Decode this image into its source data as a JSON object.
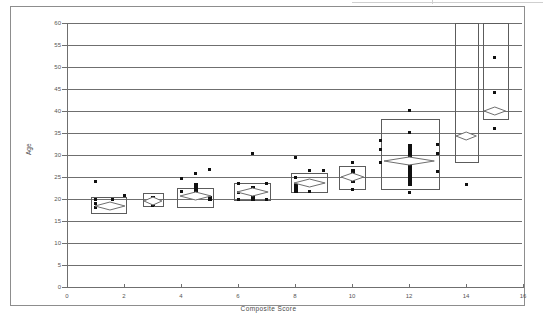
{
  "figure": {
    "background": "#ffffff",
    "frame_color": "#8d8d8d",
    "grid_color": "#6f6f6f",
    "marker_color": "#101010",
    "box_color": "#5c5c5c",
    "diamond_color": "#6f6f6f"
  },
  "chart_data": {
    "type": "scatter",
    "title": "",
    "subtitle": "",
    "xlabel": "Composite Score",
    "ylabel": "Age",
    "xlim": [
      0,
      16
    ],
    "ylim": [
      0,
      60
    ],
    "xticks": [
      0,
      2,
      4,
      6,
      8,
      10,
      12,
      14,
      16
    ],
    "yticks": [
      0,
      5,
      10,
      15,
      20,
      25,
      30,
      35,
      40,
      45,
      50,
      55,
      60
    ],
    "xtick_labels": [
      "0",
      "2",
      "4",
      "6",
      "8",
      "10",
      "12",
      "14",
      "16"
    ],
    "ytick_labels": [
      "0",
      "5",
      "10",
      "15",
      "20",
      "25",
      "30",
      "35",
      "40",
      "45",
      "50",
      "55",
      "60"
    ],
    "grid": "horizontal",
    "legend": "none",
    "points": [
      {
        "x": 1,
        "y": 24
      },
      {
        "x": 1,
        "y": 20
      },
      {
        "x": 1,
        "y": 19
      },
      {
        "x": 1,
        "y": 18
      },
      {
        "x": 1.6,
        "y": 19.8
      },
      {
        "x": 2,
        "y": 20.8
      },
      {
        "x": 3,
        "y": 20.2
      },
      {
        "x": 3,
        "y": 19.4
      },
      {
        "x": 3,
        "y": 18.6
      },
      {
        "x": 4,
        "y": 24.7
      },
      {
        "x": 4,
        "y": 21.7
      },
      {
        "x": 4.5,
        "y": 25.7
      },
      {
        "x": 4.5,
        "y": 23.4
      },
      {
        "x": 4.5,
        "y": 21.5
      },
      {
        "x": 4.5,
        "y": 20.4
      },
      {
        "x": 5,
        "y": 26.6
      },
      {
        "x": 5,
        "y": 20.1
      },
      {
        "x": 6,
        "y": 23.5
      },
      {
        "x": 6,
        "y": 21.5
      },
      {
        "x": 6,
        "y": 19.9
      },
      {
        "x": 6.5,
        "y": 30.4
      },
      {
        "x": 6.5,
        "y": 22.2
      },
      {
        "x": 6.5,
        "y": 20.3
      },
      {
        "x": 7,
        "y": 23.5
      },
      {
        "x": 7,
        "y": 19.9
      },
      {
        "x": 8,
        "y": 29.4
      },
      {
        "x": 8,
        "y": 25.0
      },
      {
        "x": 8,
        "y": 22.6
      },
      {
        "x": 8.5,
        "y": 26.5
      },
      {
        "x": 8.5,
        "y": 23.2
      },
      {
        "x": 8.5,
        "y": 21.6
      },
      {
        "x": 9,
        "y": 26.4
      },
      {
        "x": 10,
        "y": 28.4
      },
      {
        "x": 10,
        "y": 26.5
      },
      {
        "x": 10,
        "y": 24.6
      },
      {
        "x": 10,
        "y": 22.1
      },
      {
        "x": 11,
        "y": 33.3
      },
      {
        "x": 11,
        "y": 31.3
      },
      {
        "x": 11,
        "y": 28.2
      },
      {
        "x": 12,
        "y": 40.2
      },
      {
        "x": 12,
        "y": 35.2
      },
      {
        "x": 12,
        "y": 32.0
      },
      {
        "x": 12,
        "y": 31.0
      },
      {
        "x": 12,
        "y": 29.0
      },
      {
        "x": 12,
        "y": 27.0
      },
      {
        "x": 12,
        "y": 25.0
      },
      {
        "x": 12,
        "y": 23.5
      },
      {
        "x": 12,
        "y": 21.4
      },
      {
        "x": 13,
        "y": 32.3
      },
      {
        "x": 13,
        "y": 30.4
      },
      {
        "x": 13,
        "y": 26.2
      },
      {
        "x": 14,
        "y": 23.2
      },
      {
        "x": 15,
        "y": 52.1
      },
      {
        "x": 15,
        "y": 44.1
      },
      {
        "x": 15,
        "y": 36.1
      }
    ],
    "boxes": [
      {
        "x_center": 1.5,
        "x_low": 0.85,
        "x_high": 2.1,
        "y_low": 16.6,
        "y_high": 20.4,
        "mean": 18.5
      },
      {
        "x_center": 3.0,
        "x_low": 2.65,
        "x_high": 3.4,
        "y_low": 18.1,
        "y_high": 21.3,
        "mean": 19.5
      },
      {
        "x_center": 4.5,
        "x_low": 3.85,
        "x_high": 5.15,
        "y_low": 17.9,
        "y_high": 22.4,
        "mean": 20.7
      },
      {
        "x_center": 6.5,
        "x_low": 5.85,
        "x_high": 7.15,
        "y_low": 19.6,
        "y_high": 23.7,
        "mean": 21.7
      },
      {
        "x_center": 8.5,
        "x_low": 7.85,
        "x_high": 9.15,
        "y_low": 21.3,
        "y_high": 26.0,
        "mean": 23.6
      },
      {
        "x_center": 10.0,
        "x_low": 9.55,
        "x_high": 10.5,
        "y_low": 22.0,
        "y_high": 27.6,
        "mean": 25.0
      },
      {
        "x_center": 12.0,
        "x_low": 11.0,
        "x_high": 13.1,
        "y_low": 22.0,
        "y_high": 38.2,
        "mean": 28.6
      },
      {
        "x_center": 14.0,
        "x_low": 13.6,
        "x_high": 14.45,
        "y_low": 28.1,
        "y_high": 60.0,
        "mean": 34.4
      },
      {
        "x_center": 15.0,
        "x_low": 14.6,
        "x_high": 15.5,
        "y_low": 37.9,
        "y_high": 60.0,
        "mean": 39.9
      }
    ]
  }
}
